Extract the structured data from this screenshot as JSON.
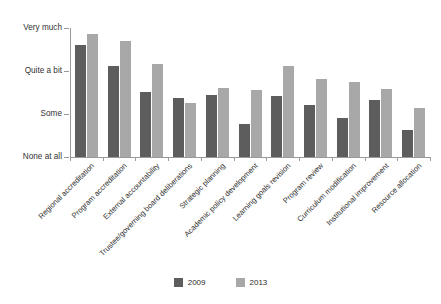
{
  "chart_data": {
    "type": "bar",
    "title": "",
    "subtitle": "",
    "xlabel": "",
    "ylabel": "",
    "grid": false,
    "legend_position": "bottom-center",
    "y_tick_labels": [
      "Very much",
      "Quite a bit",
      "Some",
      "None at all"
    ],
    "y_tick_values": [
      3,
      2,
      1,
      0
    ],
    "ylim": [
      0,
      3
    ],
    "categories": [
      "Regional accreditation",
      "Program accreditation",
      "External accountability",
      "Trustee/governing board deliberations",
      "Strategic planning",
      "Academic policy development",
      "Learning goals revision",
      "Program review",
      "Curriculum modification",
      "Institutional improvement",
      "Resource allocation"
    ],
    "series": [
      {
        "name": "2009",
        "color": "#5d5d5d",
        "values": [
          2.6,
          2.12,
          1.51,
          1.37,
          1.44,
          0.77,
          1.42,
          1.2,
          0.91,
          1.32,
          0.63
        ]
      },
      {
        "name": "2013",
        "color": "#a8a8a8",
        "values": [
          2.86,
          2.7,
          2.16,
          1.26,
          1.6,
          1.56,
          2.12,
          1.81,
          1.75,
          1.58,
          1.13
        ]
      }
    ]
  },
  "legend": {
    "items": [
      {
        "label": "2009",
        "color": "#5d5d5d"
      },
      {
        "label": "2013",
        "color": "#a8a8a8"
      }
    ]
  }
}
